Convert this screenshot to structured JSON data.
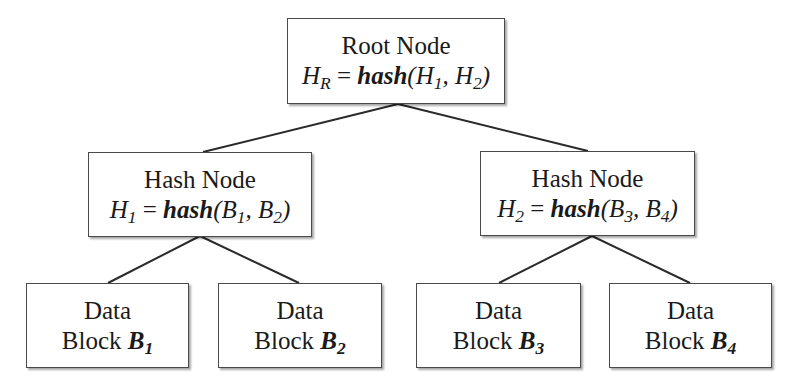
{
  "diagram": {
    "type": "merkle-tree",
    "root": {
      "title": "Root Node",
      "var": "H",
      "var_sub": "R",
      "eq": " = ",
      "fn": "hash",
      "args": [
        {
          "v": "H",
          "s": "1"
        },
        {
          "v": "H",
          "s": "2"
        }
      ]
    },
    "hash_nodes": [
      {
        "title": "Hash Node",
        "var": "H",
        "var_sub": "1",
        "eq": " = ",
        "fn": "hash",
        "args": [
          {
            "v": "B",
            "s": "1"
          },
          {
            "v": "B",
            "s": "2"
          }
        ]
      },
      {
        "title": "Hash Node",
        "var": "H",
        "var_sub": "2",
        "eq": " = ",
        "fn": "hash",
        "args": [
          {
            "v": "B",
            "s": "3"
          },
          {
            "v": "B",
            "s": "4"
          }
        ]
      }
    ],
    "data_blocks": [
      {
        "line1": "Data",
        "line2": "Block ",
        "var": "B",
        "sub": "1"
      },
      {
        "line1": "Data",
        "line2": "Block ",
        "var": "B",
        "sub": "2"
      },
      {
        "line1": "Data",
        "line2": "Block ",
        "var": "B",
        "sub": "3"
      },
      {
        "line1": "Data",
        "line2": "Block ",
        "var": "B",
        "sub": "4"
      }
    ],
    "punct": {
      "open": "(",
      "comma": ", ",
      "close": ")"
    }
  }
}
